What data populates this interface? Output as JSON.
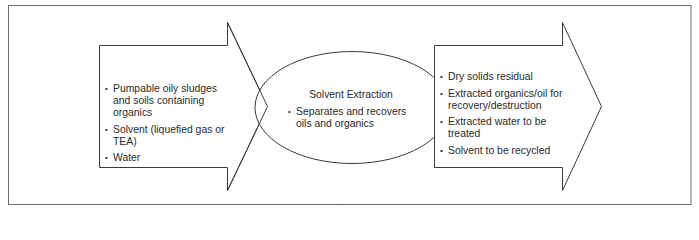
{
  "diagram": {
    "colors": {
      "stroke": "#3a3a3a",
      "frame_stroke": "#6a6a6a",
      "text": "#2a2a2a",
      "background": "#ffffff"
    },
    "input_arrow": {
      "items": [
        "Pumpable oily sludges and soils containing organics",
        "Solvent (liquefied gas or TEA)",
        "Water"
      ]
    },
    "process": {
      "title": "Solvent Extraction",
      "items": [
        "Separates and recovers oils and organics"
      ]
    },
    "output_arrow": {
      "items": [
        "Dry solids residual",
        "Extracted organics/oil for recovery/destruction",
        "Extracted water to be treated",
        "Solvent to be recycled"
      ]
    },
    "bullet_glyph": "•"
  }
}
